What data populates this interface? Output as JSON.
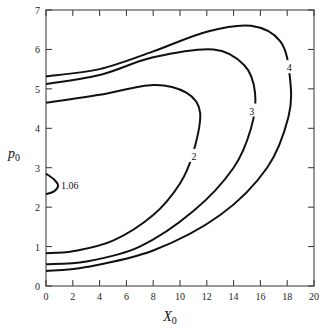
{
  "chart_data": {
    "type": "contour",
    "title": "",
    "xlabel": "X",
    "xlabel_sub": "0",
    "ylabel": "p",
    "ylabel_sub": "0",
    "xlim": [
      0,
      20
    ],
    "ylim": [
      0,
      7
    ],
    "x_ticks": [
      "0",
      "2",
      "4",
      "6",
      "8",
      "10",
      "12",
      "14",
      "16",
      "18",
      "20"
    ],
    "y_ticks": [
      "0",
      "1",
      "2",
      "3",
      "4",
      "5",
      "6",
      "7"
    ],
    "grid": false,
    "legend": null,
    "contours": [
      {
        "level": "1.06",
        "label": "1.06",
        "points": [
          [
            0,
            2.85
          ],
          [
            0.6,
            2.7
          ],
          [
            0.9,
            2.55
          ],
          [
            0.6,
            2.4
          ],
          [
            0,
            2.33
          ]
        ]
      },
      {
        "level": "2",
        "label": "2",
        "points": [
          [
            0,
            4.65
          ],
          [
            4,
            4.85
          ],
          [
            8,
            5.1
          ],
          [
            10.5,
            4.9
          ],
          [
            11.5,
            4.4
          ],
          [
            11,
            3.4
          ],
          [
            10,
            2.6
          ],
          [
            8,
            1.8
          ],
          [
            5,
            1.15
          ],
          [
            2,
            0.88
          ],
          [
            0,
            0.83
          ]
        ]
      },
      {
        "level": "3",
        "label": "3",
        "points": [
          [
            0,
            5.12
          ],
          [
            4,
            5.35
          ],
          [
            8,
            5.8
          ],
          [
            12.5,
            6.0
          ],
          [
            14.8,
            5.6
          ],
          [
            15.6,
            4.9
          ],
          [
            15.3,
            4.0
          ],
          [
            14,
            3.0
          ],
          [
            11,
            1.9
          ],
          [
            7,
            1.0
          ],
          [
            3,
            0.62
          ],
          [
            0,
            0.55
          ]
        ]
      },
      {
        "level": "4",
        "label": "4",
        "points": [
          [
            0,
            5.32
          ],
          [
            4,
            5.5
          ],
          [
            8,
            5.95
          ],
          [
            12,
            6.45
          ],
          [
            15.3,
            6.6
          ],
          [
            17.5,
            6.2
          ],
          [
            18.2,
            5.3
          ],
          [
            18.1,
            4.3
          ],
          [
            16.5,
            3.0
          ],
          [
            13,
            1.8
          ],
          [
            8,
            0.9
          ],
          [
            3,
            0.48
          ],
          [
            0,
            0.38
          ]
        ]
      }
    ]
  }
}
